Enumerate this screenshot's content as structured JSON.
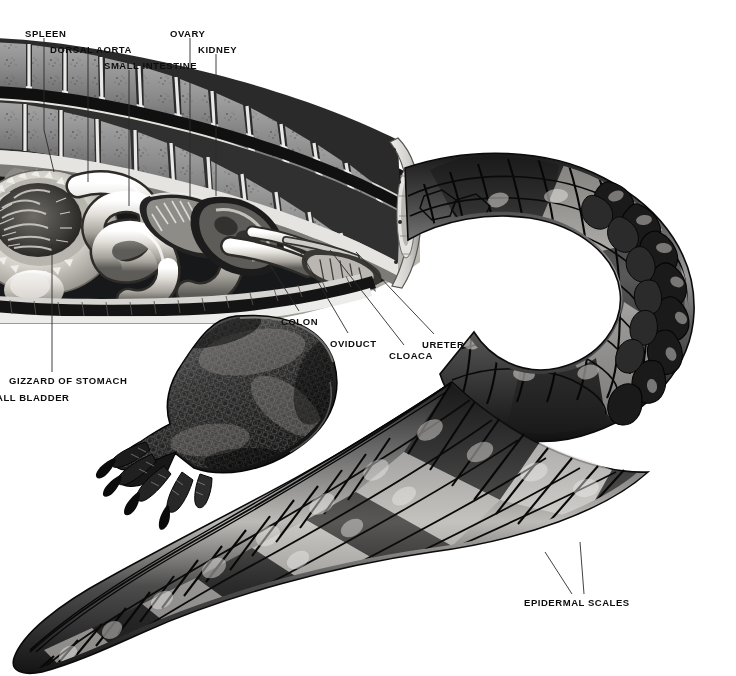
{
  "figure": {
    "style": "black-and-white airbrush / scraperboard scientific illustration",
    "background_color": "#ffffff",
    "ink_color": "#0d0d0d",
    "leader_line_color": "#2b2b2b",
    "bone_fill": "#8d8d8d",
    "viscera_light": "#e8e6e2",
    "scale_dark": "#1d1d1d",
    "scale_mid": "#6a6a6a",
    "scale_light": "#cfcfcf"
  },
  "labels": [
    {
      "id": "spleen",
      "text": "SPLEEN",
      "x": 25,
      "y": 28,
      "leader": [
        [
          44,
          38
        ],
        [
          44,
          130
        ],
        [
          54,
          172
        ]
      ]
    },
    {
      "id": "dorsal-aorta",
      "text": "DORSAL AORTA",
      "x": 50,
      "y": 44,
      "leader": [
        [
          88,
          54
        ],
        [
          88,
          182
        ]
      ]
    },
    {
      "id": "small-intestine",
      "text": "SMALL INTESTINE",
      "x": 104,
      "y": 60,
      "leader": [
        [
          129,
          70
        ],
        [
          129,
          206
        ]
      ]
    },
    {
      "id": "ovary",
      "text": "OVARY",
      "x": 170,
      "y": 28,
      "leader": [
        [
          190,
          38
        ],
        [
          190,
          200
        ]
      ]
    },
    {
      "id": "kidney",
      "text": "KIDNEY",
      "x": 198,
      "y": 44,
      "leader": [
        [
          216,
          54
        ],
        [
          216,
          196
        ]
      ]
    },
    {
      "id": "colon",
      "text": "COLON",
      "x": 281,
      "y": 316,
      "leader": [
        [
          299,
          311
        ],
        [
          268,
          262
        ]
      ]
    },
    {
      "id": "oviduct",
      "text": "OVIDUCT",
      "x": 330,
      "y": 338,
      "leader": [
        [
          348,
          333
        ],
        [
          298,
          248
        ]
      ]
    },
    {
      "id": "cloaca",
      "text": "CLOACA",
      "x": 389,
      "y": 350,
      "leader": [
        [
          404,
          345
        ],
        [
          330,
          250
        ]
      ]
    },
    {
      "id": "ureter",
      "text": "URETER",
      "x": 422,
      "y": 339,
      "leader": [
        [
          434,
          334
        ],
        [
          356,
          252
        ]
      ]
    },
    {
      "id": "gizzard-of-stomach",
      "text": "GIZZARD OF STOMACH",
      "x": 9,
      "y": 375,
      "leader": [
        [
          52,
          372
        ],
        [
          52,
          244
        ]
      ]
    },
    {
      "id": "gall-bladder",
      "text": "ALL BLADDER",
      "x": -4,
      "y": 392,
      "leader": []
    },
    {
      "id": "epidermal-scales",
      "text": "EPIDERMAL SCALES",
      "x": 524,
      "y": 597,
      "leader": [
        [
          572,
          594
        ],
        [
          545,
          552
        ]
      ],
      "leader2": [
        [
          584,
          594
        ],
        [
          580,
          542
        ]
      ]
    }
  ],
  "structures": {
    "vertebral_column": "Two tiers of cut vertebrae — neural spines above, centra below — running along the dorsal edge",
    "viscera": "Coiled small intestine, gizzard/stomach cut open, spleen, ovary, kidney, colon, oviduct, ureter, cloaca",
    "hind_limb": "Left hind leg with five clawed toes, covered in small granular scales",
    "tail": "Long laterally-compressed tail curving right then sweeping down-left, with caudal scutes and a double dorsal crest; banded dark and light epidermal scales",
    "cut_face": "Transverse section through the body wall exposing the body cavity"
  }
}
